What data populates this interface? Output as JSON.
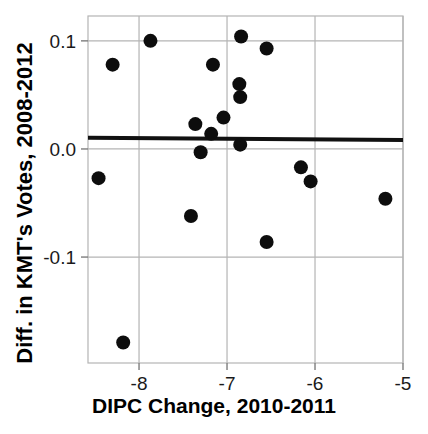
{
  "chart_data": {
    "type": "scatter",
    "title": "",
    "xlabel": "DIPC Change, 2010-2011",
    "ylabel": "Diff. in KMT's Votes, 2008-2012",
    "xlim": [
      -8.58,
      -5.0
    ],
    "ylim": [
      -0.198,
      0.123
    ],
    "xticks": [
      -8,
      -7,
      -6,
      -5
    ],
    "xtick_labels": [
      "-8",
      "-7",
      "-6",
      "-5"
    ],
    "yticks": [
      0.1,
      0.0,
      -0.1
    ],
    "ytick_labels": [
      "0.1",
      "0.0",
      "-0.1"
    ],
    "grid": true,
    "grid_color": "#b4b4b4",
    "marker_color": "#0d0d0d",
    "marker_size": 7,
    "legend": null,
    "points": [
      {
        "x": -8.46,
        "y": -0.027
      },
      {
        "x": -8.3,
        "y": 0.078
      },
      {
        "x": -8.18,
        "y": -0.179
      },
      {
        "x": -7.87,
        "y": 0.1
      },
      {
        "x": -7.41,
        "y": -0.062
      },
      {
        "x": -7.36,
        "y": 0.023
      },
      {
        "x": -7.3,
        "y": -0.003
      },
      {
        "x": -7.18,
        "y": 0.014
      },
      {
        "x": -7.16,
        "y": 0.078
      },
      {
        "x": -7.04,
        "y": 0.029
      },
      {
        "x": -6.86,
        "y": 0.06
      },
      {
        "x": -6.85,
        "y": 0.048
      },
      {
        "x": -6.85,
        "y": 0.004
      },
      {
        "x": -6.84,
        "y": 0.104
      },
      {
        "x": -6.55,
        "y": 0.093
      },
      {
        "x": -6.55,
        "y": -0.086
      },
      {
        "x": -6.16,
        "y": -0.017
      },
      {
        "x": -6.05,
        "y": -0.03
      },
      {
        "x": -5.2,
        "y": -0.046
      }
    ],
    "fit_line": {
      "name": "linear fit",
      "x_start": -8.58,
      "y_start": 0.0104,
      "x_end": -5.0,
      "y_end": 0.0083,
      "color": "#111111",
      "width": 4
    }
  }
}
